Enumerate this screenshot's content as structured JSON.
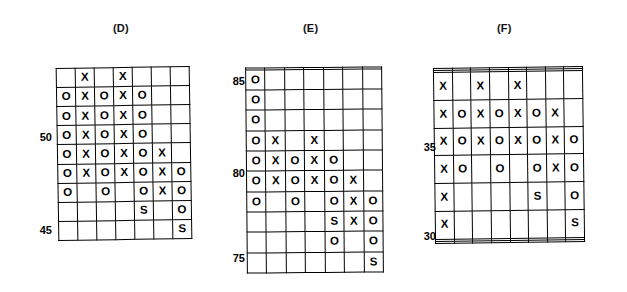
{
  "figure": {
    "background": "#ffffff",
    "ink": "#000000",
    "symbols": {
      "x": "X",
      "o": "O",
      "s": "S",
      "blank": ""
    }
  },
  "chart_data": {
    "type": "heatmap",
    "title": "",
    "subtitle": "",
    "xlabel": "",
    "ylabel": "",
    "grid": true,
    "legend_position": "none",
    "panels": [
      {
        "id": "D",
        "label": "(D)",
        "columns": 7,
        "rows": 9,
        "axis_ticks": [
          {
            "value": "50",
            "row_index": 3
          },
          {
            "value": "45",
            "row_index": 8
          }
        ],
        "cells": [
          [
            "",
            "X",
            "",
            "X",
            "",
            "",
            ""
          ],
          [
            "O",
            "X",
            "O",
            "X",
            "O",
            "",
            ""
          ],
          [
            "O",
            "X",
            "O",
            "X",
            "O",
            "",
            ""
          ],
          [
            "O",
            "X",
            "O",
            "X",
            "O",
            "",
            ""
          ],
          [
            "O",
            "X",
            "O",
            "X",
            "O",
            "X",
            ""
          ],
          [
            "O",
            "X",
            "O",
            "X",
            "O",
            "X",
            "O"
          ],
          [
            "O",
            "",
            "O",
            "",
            "O",
            "X",
            "O"
          ],
          [
            "",
            "",
            "",
            "",
            "S",
            "",
            "O"
          ],
          [
            "",
            "",
            "",
            "",
            "",
            "",
            "S"
          ]
        ]
      },
      {
        "id": "E",
        "label": "(E)",
        "columns": 7,
        "rows": 11,
        "axis_ticks": [
          {
            "value": "85",
            "row_index": 0
          },
          {
            "value": "80",
            "row_index": 5
          },
          {
            "value": "75",
            "row_index": 10
          }
        ],
        "cells": [
          [
            "",
            "",
            "",
            "",
            "",
            "",
            ""
          ],
          [
            "O",
            "",
            "",
            "",
            "",
            "",
            ""
          ],
          [
            "O",
            "",
            "",
            "",
            "",
            "",
            ""
          ],
          [
            "O",
            "",
            "",
            "",
            "",
            "",
            ""
          ],
          [
            "O",
            "X",
            "",
            "X",
            "",
            "",
            ""
          ],
          [
            "O",
            "X",
            "O",
            "X",
            "O",
            "",
            ""
          ],
          [
            "O",
            "X",
            "O",
            "X",
            "O",
            "X",
            ""
          ],
          [
            "O",
            "",
            "O",
            "",
            "O",
            "X",
            "O"
          ],
          [
            "",
            "",
            "",
            "",
            "S",
            "X",
            "O"
          ],
          [
            "",
            "",
            "",
            "",
            "O",
            "",
            "O"
          ],
          [
            "",
            "",
            "",
            "",
            "",
            "",
            "S"
          ]
        ]
      },
      {
        "id": "F",
        "label": "(F)",
        "columns": 8,
        "rows": 10,
        "axis_ticks": [
          {
            "value": "35",
            "row_index": 4
          },
          {
            "value": "30",
            "row_index": 9
          }
        ],
        "cells": [
          [
            "",
            "",
            "",
            "",
            "",
            "",
            "",
            ""
          ],
          [
            "",
            "",
            "",
            "",
            "",
            "",
            "",
            ""
          ],
          [
            "X",
            "",
            "X",
            "",
            "X",
            "",
            "",
            ""
          ],
          [
            "X",
            "O",
            "X",
            "O",
            "X",
            "O",
            "X",
            ""
          ],
          [
            "X",
            "O",
            "X",
            "O",
            "X",
            "O",
            "X",
            "O"
          ],
          [
            "X",
            "O",
            "",
            "O",
            "",
            "O",
            "X",
            "O"
          ],
          [
            "X",
            "",
            "",
            "",
            "",
            "S",
            "",
            "O"
          ],
          [
            "X",
            "",
            "",
            "",
            "",
            "",
            "",
            "S"
          ],
          [
            "",
            "",
            "",
            "",
            "",
            "",
            "",
            ""
          ],
          [
            "",
            "",
            "",
            "",
            "",
            "",
            "",
            ""
          ]
        ]
      }
    ]
  }
}
